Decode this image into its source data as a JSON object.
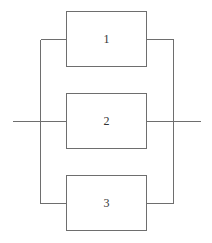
{
  "diagram": {
    "type": "parallel-system-block-diagram",
    "colors": {
      "line": "#6e6e6e",
      "text": "#333333",
      "background": "#ffffff"
    },
    "blocks": [
      {
        "id": "1",
        "label": "1"
      },
      {
        "id": "2",
        "label": "2"
      },
      {
        "id": "3",
        "label": "3"
      }
    ],
    "connections": [
      {
        "from": "input",
        "to": "1"
      },
      {
        "from": "input",
        "to": "2"
      },
      {
        "from": "input",
        "to": "3"
      },
      {
        "from": "1",
        "to": "output"
      },
      {
        "from": "2",
        "to": "output"
      },
      {
        "from": "3",
        "to": "output"
      }
    ]
  }
}
